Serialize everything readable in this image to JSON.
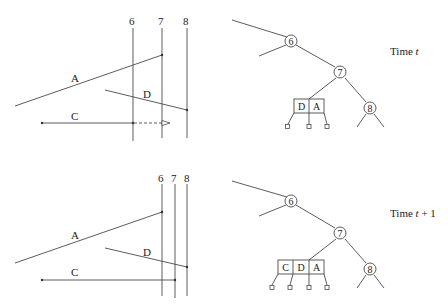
{
  "panels": [
    {
      "id": "time_t",
      "time_label_prefix": "Time ",
      "time_label_var": "t",
      "time_label_suffix": "",
      "sweep_lines": [
        {
          "label": "6"
        },
        {
          "label": "7"
        },
        {
          "label": "8"
        }
      ],
      "segments": [
        {
          "label": "A"
        },
        {
          "label": "D"
        },
        {
          "label": "C"
        }
      ],
      "tree": {
        "nodes": [
          "6",
          "7",
          "8"
        ],
        "leaf_box": [
          "D",
          "A"
        ]
      }
    },
    {
      "id": "time_t_plus_1",
      "time_label_prefix": "Time ",
      "time_label_var": "t",
      "time_label_suffix": " + 1",
      "sweep_lines": [
        {
          "label": "6"
        },
        {
          "label": "7"
        },
        {
          "label": "8"
        }
      ],
      "segments": [
        {
          "label": "A"
        },
        {
          "label": "D"
        },
        {
          "label": "C"
        }
      ],
      "tree": {
        "nodes": [
          "6",
          "7",
          "8"
        ],
        "leaf_box": [
          "C",
          "D",
          "A"
        ]
      }
    }
  ]
}
